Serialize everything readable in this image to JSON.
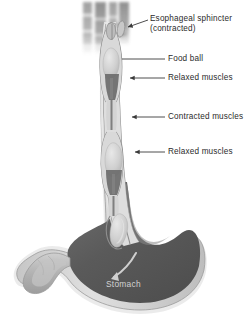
{
  "figure": {
    "background_color": "#ffffff"
  },
  "colors": {
    "label_text": "#2b2b2b",
    "stomach_label_text": "#d2d2d2",
    "leader_line": "#3a3a3a",
    "organ_wall_outline": "#8d8d8d",
    "organ_wall_fill": "#d6d6d6",
    "organ_outer_halo": "#e4e4e4",
    "lumen_dark": "#5c5c5c",
    "stomach_interior": "#5a5a5a",
    "stomach_interior_light": "#7b7b7b",
    "bolus_fill": "#cfcfcf",
    "contracted_muscle": "#6b6b6b",
    "spine_gray": "#9a9a9a",
    "duodenum_fill": "#b8b8b8",
    "arrow_in_stomach": "#cccccc"
  },
  "labels": [
    {
      "id": "esophageal-sphincter",
      "line1": "Esophageal sphincter",
      "line2": "(contracted)",
      "text_x": 150,
      "text_y": 14,
      "leader": {
        "type": "arrow",
        "from_x": 148,
        "from_y": 20,
        "to_x": 127,
        "to_y": 27
      }
    },
    {
      "id": "food-ball",
      "line1": "Food ball",
      "line2": "",
      "text_x": 168,
      "text_y": 55,
      "leader": {
        "type": "plain",
        "from_x": 165,
        "from_y": 59,
        "to_x": 123,
        "to_y": 59
      }
    },
    {
      "id": "relaxed-muscles-upper",
      "line1": "Relaxed muscles",
      "line2": "",
      "text_x": 168,
      "text_y": 74,
      "leader": {
        "type": "arrow",
        "from_x": 165,
        "from_y": 78,
        "to_x": 131,
        "to_y": 78
      }
    },
    {
      "id": "contracted-muscles",
      "line1": "Contracted muscles",
      "line2": "",
      "text_x": 168,
      "text_y": 113,
      "leader": {
        "type": "arrow",
        "from_x": 165,
        "from_y": 117,
        "to_x": 133,
        "to_y": 117
      }
    },
    {
      "id": "relaxed-muscles-lower",
      "line1": "Relaxed muscles",
      "line2": "",
      "text_x": 168,
      "text_y": 148,
      "leader": {
        "type": "arrow",
        "from_x": 165,
        "from_y": 152,
        "to_x": 136,
        "to_y": 152
      }
    }
  ],
  "stomach_label": {
    "text": "Stomach",
    "text_x": 106,
    "text_y": 285
  },
  "anatomy": {
    "spine_label": "vertebral-column",
    "esophagus_label": "esophagus",
    "stomach_body_label": "stomach-body",
    "duodenum_label": "duodenum",
    "boluses": [
      {
        "id": "bolus-upper",
        "cx": 120,
        "cy": 63
      },
      {
        "id": "bolus-middle",
        "cx": 128,
        "cy": 150
      },
      {
        "id": "bolus-lower",
        "cx": 134,
        "cy": 228
      }
    ],
    "peristalsis_arrow": {
      "id": "peristalsis-arrow",
      "description": "curved arrow showing food movement into stomach"
    }
  }
}
